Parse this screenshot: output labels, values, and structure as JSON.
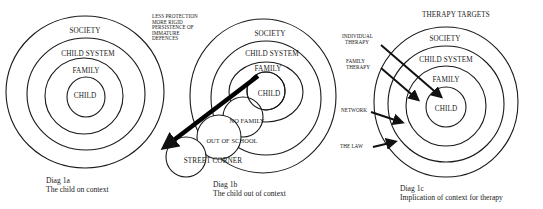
{
  "diagrams": [
    {
      "id": "1a",
      "caption_line1": "Diag 1a",
      "caption_line2": "The child on context",
      "rings": [
        "SOCIETY",
        "CHILD SYSTEM",
        "FAMILY",
        "CHILD"
      ]
    },
    {
      "id": "1b",
      "caption_line1": "Diag 1b",
      "caption_line2": "The child out of context",
      "rings": [
        "SOCIETY",
        "CHILD SYSTEM",
        "FAMILY",
        "CHILD"
      ],
      "displaced": [
        "NO FAMILY",
        "OUT OF SCHOOL",
        "STREET CORNER"
      ],
      "note": [
        "LESS PROTECTION",
        "MORE RIGID",
        "PERSISTENCE OF",
        "IMMATURE",
        "DEFENCES"
      ]
    },
    {
      "id": "1c",
      "title": "THERAPY TARGETS",
      "caption_line1": "Diag 1c",
      "caption_line2": "Implication of context for therapy",
      "rings": [
        "SOCIETY",
        "CHILD SYSTEM",
        "FAMILY",
        "CHILD"
      ],
      "targets": [
        {
          "line1": "INDIVIDUAL",
          "line2": "THERAPY",
          "target_ring": "CHILD"
        },
        {
          "line1": "FAMILY",
          "line2": "THERAPY",
          "target_ring": "FAMILY"
        },
        {
          "line1": "NETWORK",
          "line2": "",
          "target_ring": "CHILD SYSTEM"
        },
        {
          "line1": "THE LAW",
          "line2": "",
          "target_ring": "SOCIETY"
        }
      ]
    }
  ],
  "colors": {
    "ink": "#1a1a1a",
    "background": "#ffffff"
  }
}
